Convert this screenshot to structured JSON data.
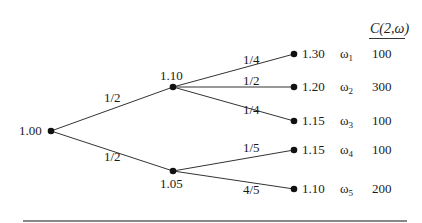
{
  "header": {
    "label": "C(2,ω)"
  },
  "nodes": {
    "root": {
      "value": "1.00",
      "x": 51,
      "y": 131
    },
    "up": {
      "value": "1.10",
      "x": 173,
      "y": 87
    },
    "down": {
      "value": "1.05",
      "x": 173,
      "y": 171
    }
  },
  "edges": {
    "root_up": {
      "prob": "1/2"
    },
    "root_down": {
      "prob": "1/2"
    },
    "up_1": {
      "prob": "1/4"
    },
    "up_2": {
      "prob": "1/2"
    },
    "up_3": {
      "prob": "1/4"
    },
    "down_4": {
      "prob": "1/5"
    },
    "down_5": {
      "prob": "4/5"
    }
  },
  "leaves": [
    {
      "value": "1.30",
      "omega": "ω",
      "index": "1",
      "c": "100",
      "y": 54
    },
    {
      "value": "1.20",
      "omega": "ω",
      "index": "2",
      "c": "300",
      "y": 87
    },
    {
      "value": "1.15",
      "omega": "ω",
      "index": "3",
      "c": "100",
      "y": 121
    },
    {
      "value": "1.15",
      "omega": "ω",
      "index": "4",
      "c": "100",
      "y": 150
    },
    {
      "value": "1.10",
      "omega": "ω",
      "index": "5",
      "c": "200",
      "y": 189
    }
  ]
}
